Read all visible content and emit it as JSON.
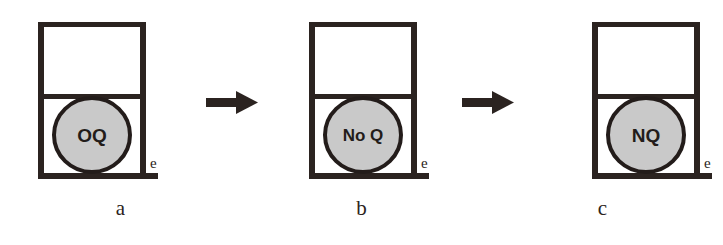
{
  "figure": {
    "type": "process-sequence-diagram",
    "panel_count": 3,
    "arrow_count": 2,
    "colors": {
      "stroke": "#2b2320",
      "ellipse_fill": "#c9c9c9",
      "ellipse_stroke": "#231c1a",
      "background": "#ffffff",
      "text": "#2b2320"
    }
  },
  "panels": [
    {
      "id": "panel-a",
      "caption": "a",
      "ellipse_label": "OQ",
      "baseline_label": "e",
      "ellipse_label_font_size": 19
    },
    {
      "id": "panel-b",
      "caption": "b",
      "ellipse_label": "No Q",
      "baseline_label": "e",
      "ellipse_label_font_size": 17
    },
    {
      "id": "panel-c",
      "caption": "c",
      "ellipse_label": "NQ",
      "baseline_label": "e",
      "ellipse_label_font_size": 19
    }
  ],
  "arrows": [
    {
      "id": "arrow-1",
      "direction": "right"
    },
    {
      "id": "arrow-2",
      "direction": "right"
    }
  ]
}
